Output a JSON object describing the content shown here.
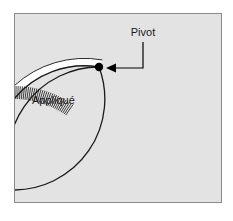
{
  "figure": {
    "panel": {
      "background_color": "#e3e3e3",
      "border_color": "#8a8a8a",
      "outside_color": "#ffffff",
      "x": 14,
      "y": 13,
      "width": 208,
      "height": 190
    },
    "labels": {
      "appliqué": "Appliqué",
      "pivot": "Pivot"
    },
    "annotations": {
      "pivot_dot_color": "#000000",
      "leader_line_color": "#000000",
      "arc_color": "#1a1a1a",
      "stitch_band_fill": "#ffffff",
      "stitch_line_color": "#2b2b2b"
    },
    "geometry": {
      "arc_center_x": 14,
      "arc_center_y": 190,
      "arc_radius": 91,
      "band_width": 13,
      "pivot_x": 99,
      "pivot_y": 67,
      "pivot_dot_radius": 4,
      "stitch_count": 30,
      "arrow_tip_x": 107,
      "arrow_tip_y": 68,
      "leader_corner_x": 143,
      "leader_top_y": 42
    }
  }
}
